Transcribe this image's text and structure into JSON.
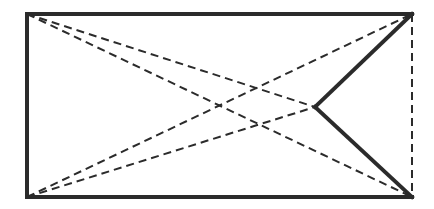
{
  "diagram": {
    "width": 434,
    "height": 209,
    "colors": {
      "stroke": "#2b2b2b",
      "background": "#ffffff"
    },
    "points": {
      "A": [
        27,
        14
      ],
      "B": [
        412,
        14
      ],
      "C": [
        412,
        197
      ],
      "D": [
        27,
        197
      ],
      "P": [
        315,
        107
      ]
    },
    "solid_segments": [
      [
        "B",
        "A"
      ],
      [
        "A",
        "D"
      ],
      [
        "D",
        "C"
      ],
      [
        "B",
        "P"
      ],
      [
        "P",
        "C"
      ]
    ],
    "dashed_segments": [
      [
        "B",
        "C"
      ],
      [
        "A",
        "P"
      ],
      [
        "A",
        "C"
      ],
      [
        "D",
        "P"
      ],
      [
        "D",
        "B"
      ]
    ]
  }
}
